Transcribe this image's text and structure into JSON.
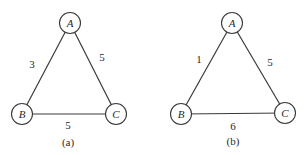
{
  "figures": [
    {
      "caption": "(a)",
      "nodes": [
        {
          "id": "A",
          "label": "A",
          "x": 70,
          "y": 23
        },
        {
          "id": "B",
          "label": "B",
          "x": 22,
          "y": 114
        },
        {
          "id": "C",
          "label": "C",
          "x": 116,
          "y": 114
        }
      ],
      "edges": [
        {
          "from": "A",
          "to": "B",
          "weight": "3"
        },
        {
          "from": "A",
          "to": "C",
          "weight": "5"
        },
        {
          "from": "B",
          "to": "C",
          "weight": "5"
        }
      ]
    },
    {
      "caption": "(b)",
      "nodes": [
        {
          "id": "A",
          "label": "A",
          "x": 232,
          "y": 23
        },
        {
          "id": "B",
          "label": "B",
          "x": 181,
          "y": 114
        },
        {
          "id": "C",
          "label": "C",
          "x": 285,
          "y": 113
        }
      ],
      "edges": [
        {
          "from": "A",
          "to": "B",
          "weight": "1"
        },
        {
          "from": "A",
          "to": "C",
          "weight": "5"
        },
        {
          "from": "B",
          "to": "C",
          "weight": "6"
        }
      ]
    }
  ]
}
